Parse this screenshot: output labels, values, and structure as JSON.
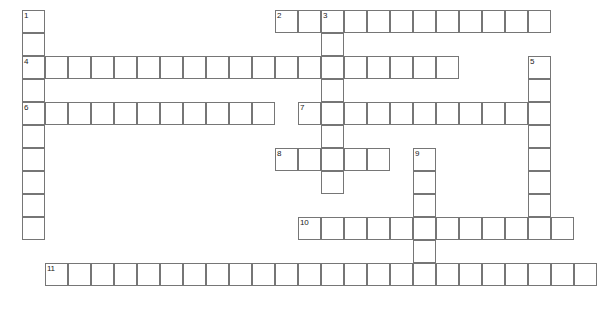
{
  "puzzle": {
    "title": "Crossword Puzzle Grid",
    "cell_size": 23,
    "origin_x": 22,
    "origin_y": 10,
    "grid_color": "#767676",
    "number_color": "#1a1a1a",
    "background_color": "#ffffff",
    "width": 609,
    "height": 314,
    "entries": [
      {
        "number": "1",
        "direction": "down",
        "col": 0,
        "row": 0,
        "length": 10
      },
      {
        "number": "2",
        "direction": "across",
        "col": 11,
        "row": 0,
        "length": 12
      },
      {
        "number": "3",
        "direction": "down",
        "col": 13,
        "row": 0,
        "length": 8
      },
      {
        "number": "4",
        "direction": "across",
        "col": 0,
        "row": 2,
        "length": 19
      },
      {
        "number": "5",
        "direction": "down",
        "col": 22,
        "row": 2,
        "length": 7
      },
      {
        "number": "6",
        "direction": "across",
        "col": 0,
        "row": 4,
        "length": 11
      },
      {
        "number": "7",
        "direction": "across",
        "col": 12,
        "row": 4,
        "length": 11
      },
      {
        "number": "8",
        "direction": "across",
        "col": 11,
        "row": 6,
        "length": 5
      },
      {
        "number": "9",
        "direction": "down",
        "col": 17,
        "row": 6,
        "length": 6
      },
      {
        "number": "10",
        "direction": "across",
        "col": 12,
        "row": 9,
        "length": 12
      },
      {
        "number": "11",
        "direction": "across",
        "col": 1,
        "row": 11,
        "length": 24
      }
    ]
  }
}
